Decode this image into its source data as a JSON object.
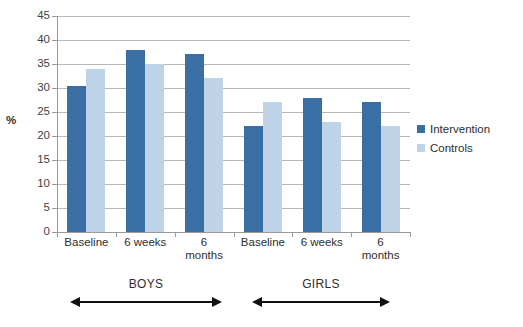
{
  "chart_data": {
    "type": "bar",
    "title": "",
    "xlabel": "",
    "ylabel": "%",
    "ylim": [
      0,
      45
    ],
    "yticks": [
      0,
      5,
      10,
      15,
      20,
      25,
      30,
      35,
      40,
      45
    ],
    "grid": true,
    "legend_position": "right",
    "categories": [
      "Baseline",
      "6 weeks",
      "6 months",
      "Baseline",
      "6 weeks",
      "6 months"
    ],
    "groups": [
      {
        "name": "BOYS",
        "categories": [
          "Baseline",
          "6 weeks",
          "6 months"
        ]
      },
      {
        "name": "GIRLS",
        "categories": [
          "Baseline",
          "6 weeks",
          "6 months"
        ]
      }
    ],
    "series": [
      {
        "name": "Intervention",
        "color": "#3a6fa5",
        "values": [
          30.5,
          38,
          37,
          22,
          28,
          27
        ]
      },
      {
        "name": "Controls",
        "color": "#bed2e8",
        "values": [
          34,
          35,
          32,
          27,
          23,
          22
        ]
      }
    ]
  },
  "axis": {
    "y_title": "%",
    "y_tick_labels": [
      "45",
      "40",
      "35",
      "30",
      "25",
      "20",
      "15",
      "10",
      "5",
      "0"
    ]
  },
  "category_labels": [
    {
      "line1": "Baseline",
      "line2": ""
    },
    {
      "line1": "6 weeks",
      "line2": ""
    },
    {
      "line1": "6",
      "line2": "months"
    },
    {
      "line1": "Baseline",
      "line2": ""
    },
    {
      "line1": "6 weeks",
      "line2": ""
    },
    {
      "line1": "6",
      "line2": "months"
    }
  ],
  "group_labels": [
    {
      "name": "BOYS"
    },
    {
      "name": "GIRLS"
    }
  ],
  "legend": {
    "items": [
      {
        "label": "Intervention",
        "color": "#3a6fa5"
      },
      {
        "label": "Controls",
        "color": "#bed2e8"
      }
    ]
  },
  "title_remnant": "",
  "colors": {
    "intervention": "#3a6fa5",
    "controls": "#bed2e8",
    "gridline": "#b8b8b8",
    "axis": "#9a9a9a",
    "text": "#2e2e2e",
    "background": "#ffffff"
  }
}
